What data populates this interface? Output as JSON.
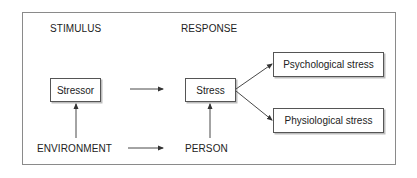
{
  "diagram": {
    "headers": {
      "stimulus": "STIMULUS",
      "response": "RESPONSE"
    },
    "nodes": {
      "stressor": "Stressor",
      "stress": "Stress",
      "psychological": "Psychological stress",
      "physiological": "Physiological stress",
      "environment": "ENVIRONMENT",
      "person": "PERSON"
    },
    "edges": [
      {
        "from": "environment",
        "to": "stressor"
      },
      {
        "from": "person",
        "to": "stress"
      },
      {
        "from": "stressor",
        "to": "stress"
      },
      {
        "from": "environment",
        "to": "person"
      },
      {
        "from": "stress",
        "to": "psychological"
      },
      {
        "from": "stress",
        "to": "physiological"
      }
    ],
    "colors": {
      "line": "#333333",
      "frame": "#8a8a8a",
      "shadow": "#bdbdbd"
    }
  }
}
